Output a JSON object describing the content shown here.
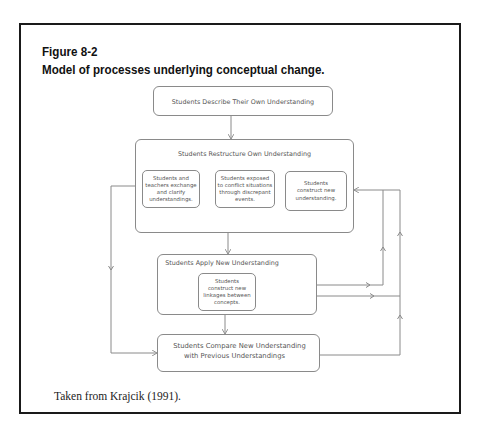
{
  "figure": {
    "title": "Figure 8-2",
    "subtitle": "Model of processes underlying conceptual change.",
    "caption": "Taken from Krajcik (1991)."
  },
  "nodes": {
    "describe": {
      "label": "Students Describe Their Own Understanding"
    },
    "restructure": {
      "label": "Students Restructure Own Understanding",
      "children": [
        {
          "label": "Students and\nteachers  exchange\nand clarify\nunderstandings."
        },
        {
          "label": "Students exposed\nto conflict situations\nthrough discrepant\nevents."
        },
        {
          "label": "Students\nconstruct new\nunderstanding."
        }
      ]
    },
    "apply": {
      "label": "Students Apply New Understanding",
      "children": [
        {
          "label": "Students\nconstruct new\nlinkages between\nconcepts."
        }
      ]
    },
    "compare": {
      "label_line1": "Students Compare New Understanding",
      "label_line2": "with Previous Understandings"
    }
  },
  "edges": [
    {
      "from": "describe",
      "to": "restructure"
    },
    {
      "from": "restructure",
      "to": "apply"
    },
    {
      "from": "apply",
      "to": "compare"
    },
    {
      "from": "restructure",
      "to": "compare",
      "route": "left-feedback"
    },
    {
      "from": "apply",
      "to": "restructure",
      "route": "right-feedback-inner"
    },
    {
      "from": "apply",
      "to": "restructure",
      "route": "right-feedback-outer"
    },
    {
      "from": "compare",
      "to": "restructure",
      "route": "right-feedback-outer"
    }
  ],
  "colors": {
    "frame": "#1a1a1a",
    "line": "#8a8a8a",
    "text": "#555555"
  }
}
